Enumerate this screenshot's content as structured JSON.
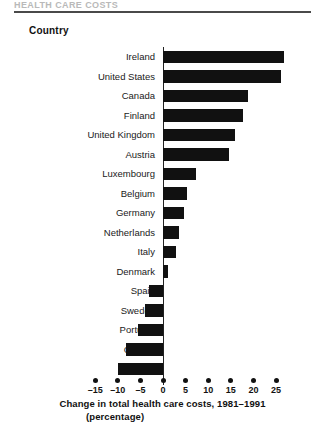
{
  "page": {
    "running_head": "HEALTH CARE COSTS",
    "column_header": "Country"
  },
  "chart_data": {
    "type": "bar",
    "orientation": "horizontal",
    "title": "",
    "xlabel": "Change in total health care costs, 1981–1991",
    "xlabel_line2": "(percentage)",
    "ylabel": "Country",
    "xlim": [
      -16,
      27
    ],
    "grid": false,
    "legend": null,
    "bar_color": "#111111",
    "xticks": [
      -15,
      -10,
      -5,
      0,
      5,
      10,
      15,
      20,
      25
    ],
    "xticklabels": [
      "–15",
      "–10",
      "–5",
      "0",
      "5",
      "10",
      "15",
      "20",
      "25"
    ],
    "categories": [
      "Ireland",
      "United States",
      "Canada",
      "Finland",
      "United Kingdom",
      "Austria",
      "Luxembourg",
      "Belgium",
      "Germany",
      "Netherlands",
      "Italy",
      "Denmark",
      "Spain",
      "Sweden",
      "Portugal",
      "Greece",
      "France"
    ],
    "values": [
      26.8,
      26.2,
      18.7,
      17.8,
      16.0,
      14.5,
      7.2,
      5.2,
      4.6,
      3.6,
      2.9,
      1.0,
      -3.0,
      -4.0,
      -5.6,
      -8.2,
      -10.0
    ]
  }
}
